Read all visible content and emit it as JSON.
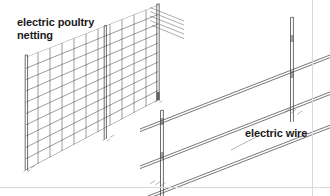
{
  "figure": {
    "background_color": "#ffffff",
    "ink_color": "#3c3c3c",
    "frame_color": "#d9d9d9",
    "width": 330,
    "height": 196
  },
  "labels": {
    "netting": "electric poultry\nnetting",
    "netting_line1": "electric poultry",
    "netting_line2": "netting",
    "wire": "electric wire"
  },
  "diagram_data": {
    "type": "technical-line-drawing",
    "projection": "isometric",
    "components": [
      {
        "name": "electric-poultry-netting",
        "label": "electric poultry netting",
        "description": "Rectangular mesh panel receding to the upper right, supported by three vertical posts",
        "mesh_rows": 10,
        "mesh_columns": 11,
        "posts": 3
      },
      {
        "name": "electric-wire-fence",
        "label": "electric wire",
        "description": "Three parallel strands of wire rising to the upper right, carried on two T-posts",
        "wire_strands": 3,
        "posts": 2
      }
    ]
  }
}
